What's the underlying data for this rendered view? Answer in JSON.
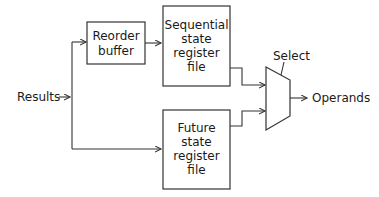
{
  "diagram": {
    "inputs": {
      "results": "Results"
    },
    "outputs": {
      "operands": "Operands"
    },
    "control": {
      "select": "Select"
    },
    "blocks": {
      "reorder_buffer": {
        "lines": [
          "Reorder",
          "buffer"
        ]
      },
      "sequential_rf": {
        "lines": [
          "Sequential",
          "state",
          "register",
          "file"
        ]
      },
      "future_rf": {
        "lines": [
          "Future",
          "state",
          "register",
          "file"
        ]
      }
    },
    "mux": {
      "name": "multiplexer",
      "inputs": 2
    },
    "colors": {
      "stroke": "#333333",
      "text": "#1a1a1a",
      "background": "#ffffff"
    }
  }
}
